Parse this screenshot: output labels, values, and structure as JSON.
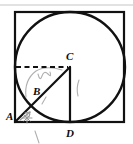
{
  "figure": {
    "background_color": "#ffffff",
    "stroke_color": "#111111",
    "faint_color": "#b9b9b9",
    "pencil_color": "#a9a9a9",
    "canvas": {
      "width": 133,
      "height": 144
    },
    "top_rule": {
      "y": 5,
      "x1": 0,
      "x2": 133,
      "color": "#d8d8d8"
    },
    "square": {
      "name": "outer-square",
      "left": 15,
      "top": 12,
      "right": 124,
      "bottom": 122,
      "side": 110,
      "stroke_width": 2.2
    },
    "circle": {
      "name": "inscribed-circle",
      "cx": 70,
      "cy": 67,
      "r": 55,
      "stroke_width": 2.4
    },
    "points": [
      {
        "id": "A",
        "label": "A",
        "x": 15,
        "y": 122,
        "label_x": 6,
        "label_y": 120,
        "role": "square-bottom-left-corner"
      },
      {
        "id": "B",
        "label": "B",
        "x": 42,
        "y": 95,
        "label_x": 33,
        "label_y": 95,
        "role": "intersection-of-AC-with-circle"
      },
      {
        "id": "C",
        "label": "C",
        "x": 70,
        "y": 67,
        "label_x": 66,
        "label_y": 60,
        "role": "circle-center"
      },
      {
        "id": "D",
        "label": "D",
        "x": 70,
        "y": 122,
        "label_x": 66,
        "label_y": 136,
        "role": "bottom-tangent-point"
      }
    ],
    "segments": [
      {
        "id": "AC",
        "name": "segment-a-to-c",
        "x1": 15,
        "y1": 122,
        "x2": 70,
        "y2": 67,
        "style": "solid",
        "stroke_width": 2.2
      },
      {
        "id": "CD",
        "name": "segment-c-to-d",
        "x1": 70,
        "y1": 67,
        "x2": 70,
        "y2": 122,
        "style": "solid",
        "stroke_width": 2.2
      }
    ],
    "dashed_segments": [
      {
        "id": "radius-left",
        "name": "dashed-radius-to-left-side",
        "x1": 16,
        "y1": 67,
        "x2": 68,
        "y2": 67,
        "style": "dashed",
        "stroke_width": 2.2,
        "dash": "5,3.5"
      }
    ],
    "pencil_marks": [
      {
        "id": "arc-scribble",
        "name": "pencil-arc-near-b",
        "d": "M 26 97 Q 24 80 36 71 Q 46 65 62 70",
        "stroke_width": 1.1
      },
      {
        "id": "squiggle",
        "name": "pencil-squiggle-near-b",
        "d": "M 38 74 Q 40 82 42 76 Q 44 70 48 74 Q 52 78 50 72",
        "stroke_width": 1.1
      },
      {
        "id": "tick-b",
        "name": "pencil-tick-below-b",
        "d": "M 46 97 L 42 104",
        "stroke_width": 1.1
      },
      {
        "id": "tick-right",
        "name": "pencil-tick-inside-circle",
        "d": "M 79 80 Q 76 88 78 96",
        "stroke_width": 1.1
      },
      {
        "id": "angle-arrow",
        "name": "pencil-angle-arrow-at-a",
        "d": "M 20 120 L 30 112",
        "stroke_width": 1.2
      },
      {
        "id": "angle-arrow-head1",
        "name": "pencil-arrowhead-a",
        "d": "M 30 112 L 25 113 M 30 112 L 29 117",
        "stroke_width": 1.2
      },
      {
        "id": "angle-star",
        "name": "pencil-star-at-a",
        "d": "M 24 121 L 30 115 M 24 115 L 30 121 M 27 113 L 27 123 M 22 118 L 32 118",
        "stroke_width": 1.0
      },
      {
        "id": "below-tick",
        "name": "pencil-tick-below-square",
        "d": "M 35 131 L 39 143",
        "stroke_width": 1.1
      }
    ]
  }
}
